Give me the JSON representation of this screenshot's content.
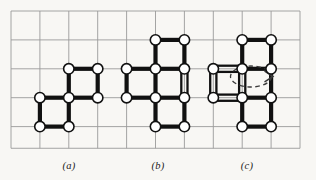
{
  "figure": {
    "kind": "lattice-animal-diagram",
    "background_color": "#f8f7f4",
    "grid": {
      "color": "#9a9a9a",
      "line_width": 0.9,
      "x0": 11,
      "y0": 11,
      "cell": 28.9,
      "cols": 10,
      "rows": 4.75,
      "visible": true
    },
    "style": {
      "edge_color": "#111111",
      "edge_width": 4.2,
      "node_fill": "#ffffff",
      "node_stroke": "#111111",
      "node_stroke_width": 1.6,
      "node_radius": 5.2,
      "dashed_color": "#3a3a3a"
    },
    "panels": [
      {
        "id": "a",
        "label": "(a)",
        "label_x": 69,
        "label_y": 160,
        "description": "two unit squares joined at a corner, staircase / skew domino",
        "squares": [
          [
            1,
            3
          ],
          [
            2,
            2
          ]
        ],
        "doubled_edges": [],
        "dashed_loop": null
      },
      {
        "id": "b",
        "label": "(b)",
        "label_x": 158,
        "label_y": 160,
        "description": "plus-shaped animal of four unit squares with one doubled vertical edge on the right",
        "squares": [
          [
            5,
            1
          ],
          [
            4,
            2
          ],
          [
            5,
            2
          ],
          [
            5,
            3
          ]
        ],
        "doubled_edges": [
          [
            6,
            2,
            6,
            3
          ]
        ],
        "dashed_loop": null
      },
      {
        "id": "c",
        "label": "(c)",
        "label_x": 247,
        "label_y": 160,
        "description": "plus-shaped animal with a doubled boundary around the left cell and a dashed oriented loop inside it",
        "squares": [
          [
            8,
            1
          ],
          [
            7,
            2
          ],
          [
            8,
            2
          ],
          [
            8,
            3
          ]
        ],
        "doubled_edges": [
          [
            7,
            2,
            8,
            2
          ],
          [
            7,
            3,
            8,
            3
          ],
          [
            7,
            2,
            7,
            3
          ],
          [
            8,
            2,
            8,
            3
          ]
        ],
        "dashed_loop": {
          "cx": 251.0,
          "cy": 76.5,
          "rx": 20.5,
          "ry": 10.5,
          "arrow": "right"
        }
      }
    ]
  }
}
